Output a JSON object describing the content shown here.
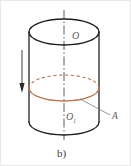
{
  "figure": {
    "caption": "b)",
    "background_color": "#ffffff",
    "frame_color": "#e8e8e8",
    "outline_color": "#1f1f1f",
    "axis_color": "#4a4a4a",
    "highlight_color": "#b5764f",
    "label_color": "#5a5a5a",
    "arrow_color": "#2b2b2b",
    "labels": [
      {
        "id": "center-top",
        "text": "O",
        "x": 72,
        "y": 36
      },
      {
        "id": "center-bottom",
        "text": "O",
        "subscript": "1",
        "x": 66,
        "y": 117
      },
      {
        "id": "point-a",
        "text": "A",
        "x": 113,
        "y": 116
      }
    ],
    "elements": {
      "top_ellipse": "cylinder top rim (solid ellipse)",
      "bottom_ellipse": "cylinder bottom rim (front arc solid, back arc hidden)",
      "cross_section_ellipse": "horizontal cross-section highlighted in orange, back half dashed",
      "axis": "vertical dash-dot centre line through O and O1",
      "leader_line": "thin line from cross-section rim to label A",
      "motion_arrow": "downward arrow at left indicating direction of motion"
    },
    "geometry": {
      "cylinder_center_x": 64,
      "cylinder_radius_x": 35,
      "ellipse_radius_y": 13,
      "top_rim_y": 32,
      "bottom_rim_y": 122,
      "cross_section_y": 88,
      "axis_top_y": 10,
      "axis_bottom_y": 140,
      "arrow_x": 22,
      "arrow_top_y": 50,
      "arrow_bottom_y": 92
    }
  }
}
